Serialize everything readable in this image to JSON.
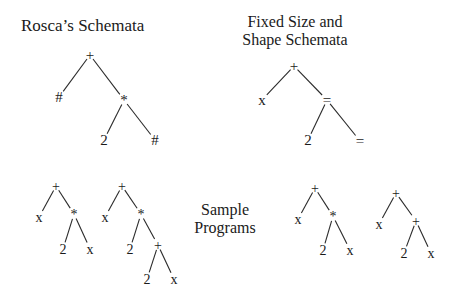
{
  "titles": {
    "rosca": "Rosca’s Schemata",
    "fixed_line1": "Fixed Size and",
    "fixed_line2": "Shape Schemata",
    "sample_line1": "Sample",
    "sample_line2": "Programs"
  },
  "trees": [
    {
      "id": "rosca-schema",
      "font_size": 15,
      "nodes": [
        {
          "id": "r0",
          "label": "+",
          "x": 90,
          "y": 55
        },
        {
          "id": "r1",
          "label": "#",
          "x": 59,
          "y": 97
        },
        {
          "id": "r2",
          "label": "*",
          "x": 124,
          "y": 100
        },
        {
          "id": "r3",
          "label": "2",
          "x": 104,
          "y": 140
        },
        {
          "id": "r4",
          "label": "#",
          "x": 155,
          "y": 140
        }
      ],
      "edges": [
        [
          "r0",
          "r1"
        ],
        [
          "r0",
          "r2"
        ],
        [
          "r2",
          "r3"
        ],
        [
          "r2",
          "r4"
        ]
      ]
    },
    {
      "id": "fixed-schema",
      "font_size": 15,
      "nodes": [
        {
          "id": "f0",
          "label": "+",
          "x": 294,
          "y": 66
        },
        {
          "id": "f1",
          "label": "x",
          "x": 262,
          "y": 100
        },
        {
          "id": "f2",
          "label": "=",
          "x": 327,
          "y": 100
        },
        {
          "id": "f3",
          "label": "2",
          "x": 308,
          "y": 140
        },
        {
          "id": "f4",
          "label": "=",
          "x": 360,
          "y": 141
        }
      ],
      "edges": [
        [
          "f0",
          "f1"
        ],
        [
          "f0",
          "f2"
        ],
        [
          "f2",
          "f3"
        ],
        [
          "f2",
          "f4"
        ]
      ]
    },
    {
      "id": "sample-program-1",
      "font_size": 14,
      "nodes": [
        {
          "id": "a0",
          "label": "+",
          "x": 56,
          "y": 186
        },
        {
          "id": "a1",
          "label": "x",
          "x": 39,
          "y": 217
        },
        {
          "id": "a2",
          "label": "*",
          "x": 74,
          "y": 214
        },
        {
          "id": "a3",
          "label": "2",
          "x": 63,
          "y": 249
        },
        {
          "id": "a4",
          "label": "x",
          "x": 90,
          "y": 249
        }
      ],
      "edges": [
        [
          "a0",
          "a1"
        ],
        [
          "a0",
          "a2"
        ],
        [
          "a2",
          "a3"
        ],
        [
          "a2",
          "a4"
        ]
      ]
    },
    {
      "id": "sample-program-2",
      "font_size": 14,
      "nodes": [
        {
          "id": "b0",
          "label": "+",
          "x": 122,
          "y": 186
        },
        {
          "id": "b1",
          "label": "x",
          "x": 105,
          "y": 217
        },
        {
          "id": "b2",
          "label": "*",
          "x": 141,
          "y": 214
        },
        {
          "id": "b3",
          "label": "2",
          "x": 130,
          "y": 249
        },
        {
          "id": "b4",
          "label": "+",
          "x": 158,
          "y": 245
        },
        {
          "id": "b5",
          "label": "2",
          "x": 147,
          "y": 279
        },
        {
          "id": "b6",
          "label": "x",
          "x": 174,
          "y": 279
        }
      ],
      "edges": [
        [
          "b0",
          "b1"
        ],
        [
          "b0",
          "b2"
        ],
        [
          "b2",
          "b3"
        ],
        [
          "b2",
          "b4"
        ],
        [
          "b4",
          "b5"
        ],
        [
          "b4",
          "b6"
        ]
      ]
    },
    {
      "id": "sample-program-3",
      "font_size": 14,
      "nodes": [
        {
          "id": "c0",
          "label": "+",
          "x": 315,
          "y": 188
        },
        {
          "id": "c1",
          "label": "x",
          "x": 298,
          "y": 219
        },
        {
          "id": "c2",
          "label": "*",
          "x": 333,
          "y": 216
        },
        {
          "id": "c3",
          "label": "2",
          "x": 323,
          "y": 250
        },
        {
          "id": "c4",
          "label": "x",
          "x": 350,
          "y": 250
        }
      ],
      "edges": [
        [
          "c0",
          "c1"
        ],
        [
          "c0",
          "c2"
        ],
        [
          "c2",
          "c3"
        ],
        [
          "c2",
          "c4"
        ]
      ]
    },
    {
      "id": "sample-program-4",
      "font_size": 14,
      "nodes": [
        {
          "id": "d0",
          "label": "+",
          "x": 396,
          "y": 193
        },
        {
          "id": "d1",
          "label": "x",
          "x": 379,
          "y": 224
        },
        {
          "id": "d2",
          "label": "+",
          "x": 416,
          "y": 221
        },
        {
          "id": "d3",
          "label": "2",
          "x": 404,
          "y": 253
        },
        {
          "id": "d4",
          "label": "x",
          "x": 431,
          "y": 253
        }
      ],
      "edges": [
        [
          "d0",
          "d1"
        ],
        [
          "d0",
          "d2"
        ],
        [
          "d2",
          "d3"
        ],
        [
          "d2",
          "d4"
        ]
      ]
    }
  ]
}
